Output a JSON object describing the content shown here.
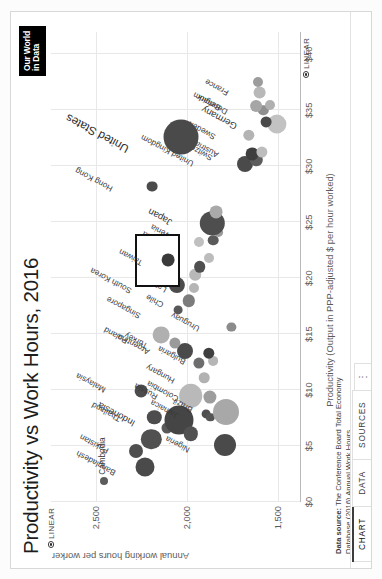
{
  "header": {
    "title": "Productivity vs Work Hours, 2016",
    "logo_line1": "Our World",
    "logo_line2": "in Data"
  },
  "tabs": [
    {
      "label": "CHART",
      "name": "tab-chart",
      "active": true
    },
    {
      "label": "DATA",
      "name": "tab-data",
      "active": false
    },
    {
      "label": "SOURCES",
      "name": "tab-sources",
      "active": false
    },
    {
      "label": "⋮",
      "name": "tab-more-menu",
      "active": false
    }
  ],
  "controls": {
    "x_scale_label": "LINEAR",
    "y_scale_label": "LINEAR"
  },
  "footer": {
    "source_label": "Data source:",
    "source_line1": "The Conference Board Total Economy",
    "source_line2": "Database (2016) Annual Work Hours",
    "license_line": "OurWorldInData.org/working-hours • CC BY-SA"
  },
  "chart_data": {
    "type": "scatter",
    "title": "Productivity vs Work Hours, 2016",
    "xlabel": "Productivity (Output in PPP-adjusted $ per hour worked)",
    "ylabel": "Annual working hours per worker",
    "xlim": [
      0,
      42
    ],
    "ylim": [
      1380,
      2750
    ],
    "xscale": "linear",
    "yscale": "linear",
    "grid": true,
    "legend": false,
    "xticks": [
      "$0",
      "$5",
      "$10",
      "$15",
      "$20",
      "$25",
      "$30",
      "$35",
      "$40"
    ],
    "xtick_values": [
      0,
      5,
      10,
      15,
      20,
      25,
      30,
      35,
      40
    ],
    "yticks": [
      "2,500",
      "2,000",
      "1,500"
    ],
    "ytick_values": [
      2500,
      2000,
      1500
    ],
    "highlighted_entity": "Taiwan",
    "size_encoding": "population",
    "points": [
      {
        "label": "Cambodia",
        "x": 1.9,
        "y": 2456,
        "r": 4.0,
        "color": "#5c5c5c",
        "lx": 6,
        "ly": -5
      },
      {
        "label": "Bangladesh",
        "x": 3.1,
        "y": 2232,
        "r": 9.5,
        "color": "#4a4a4a",
        "lx": -2,
        "ly": -36,
        "rot": -62
      },
      {
        "label": "Pakistan",
        "x": 4.6,
        "y": 2282,
        "r": 7.0,
        "color": "#4f4f4f",
        "lx": 4,
        "ly": -34,
        "rot": -62
      },
      {
        "label": "",
        "x": 5.6,
        "y": 2195,
        "r": 10.2,
        "color": "#515151"
      },
      {
        "label": "",
        "x": 6.6,
        "y": 2110,
        "r": 5.5,
        "color": "#595959"
      },
      {
        "label": "Thailand",
        "x": 7.6,
        "y": 2180,
        "r": 7.2,
        "color": "#4d4d4d",
        "lx": 2,
        "ly": -40,
        "rot": -62
      },
      {
        "label": "Malaysia",
        "x": 9.9,
        "y": 2250,
        "r": 6.4,
        "color": "#4c4c4c",
        "lx": 5,
        "ly": -42,
        "rot": -62
      },
      {
        "label": "Indonesia",
        "x": 7.3,
        "y": 2045,
        "r": 14.5,
        "color": "#454545",
        "lx": 0,
        "ly": -52,
        "rot": -62
      },
      {
        "label": "",
        "x": 6.1,
        "y": 1978,
        "r": 7.2,
        "color": "#515151"
      },
      {
        "label": "Russia",
        "x": 9.5,
        "y": 1978,
        "r": 11.8,
        "color": "#b9b9b9",
        "lx": 3,
        "ly": -40,
        "rot": -62
      },
      {
        "label": "Jamaica",
        "x": 7.9,
        "y": 1895,
        "r": 4.4,
        "color": "#4f4f4f",
        "lx": 2,
        "ly": -34,
        "rot": -62
      },
      {
        "label": "",
        "x": 7.6,
        "y": 1870,
        "r": 4.2,
        "color": "#555"
      },
      {
        "label": "Nigeria",
        "x": 5.1,
        "y": 1790,
        "r": 11.0,
        "color": "#4a4a4a",
        "lx": -1,
        "ly": -42,
        "rot": -62
      },
      {
        "label": "Brazil",
        "x": 8.0,
        "y": 1785,
        "r": 13.0,
        "color": "#a8a8a8",
        "lx": 6,
        "ly": -40,
        "rot": -62
      },
      {
        "label": "Colombia",
        "x": 9.4,
        "y": 1875,
        "r": 6.6,
        "color": "#9d9d9d",
        "lx": 2,
        "ly": -38,
        "rot": -62
      },
      {
        "label": "Hungary",
        "x": 11.1,
        "y": 1905,
        "r": 5.3,
        "color": "#b2b2b2",
        "lx": 1,
        "ly": -36,
        "rot": -62
      },
      {
        "label": "",
        "x": 12.4,
        "y": 1935,
        "r": 5.6,
        "color": "#6d6d6d"
      },
      {
        "label": "Bulgaria",
        "x": 12.6,
        "y": 1855,
        "r": 4.9,
        "color": "#b6b6b6",
        "lx": 3,
        "ly": -34,
        "rot": -62
      },
      {
        "label": "",
        "x": 13.3,
        "y": 1880,
        "r": 5.7,
        "color": "#3f3f3f"
      },
      {
        "label": "Argentina",
        "x": 13.5,
        "y": 2010,
        "r": 8.0,
        "color": "#4a4a4a",
        "lx": 3,
        "ly": -42,
        "rot": -62
      },
      {
        "label": "Turkey",
        "x": 14.2,
        "y": 2065,
        "r": 5.6,
        "color": "#9a9a9a",
        "lx": 1,
        "ly": -34,
        "rot": -62
      },
      {
        "label": "Poland",
        "x": 14.9,
        "y": 2140,
        "r": 8.4,
        "color": "#b0b0b0",
        "lx": -2,
        "ly": -40,
        "rot": -62
      },
      {
        "label": "Uruguay",
        "x": 15.6,
        "y": 1755,
        "r": 4.6,
        "color": "#8b8b8b",
        "lx": 2,
        "ly": -38,
        "rot": -62
      },
      {
        "label": "Chile",
        "x": 18.0,
        "y": 1990,
        "r": 6.2,
        "color": "#7c7c7c",
        "lx": 0,
        "ly": -32,
        "rot": -62
      },
      {
        "label": "Latvia",
        "x": 19.1,
        "y": 1960,
        "r": 5.0,
        "color": "#b5b5b5",
        "lx": 2,
        "ly": -34,
        "rot": -62
      },
      {
        "label": "",
        "x": 20.3,
        "y": 1955,
        "r": 5.8,
        "color": "#b8b8b8"
      },
      {
        "label": "Slovakia",
        "x": 21.8,
        "y": 1880,
        "r": 5.0,
        "color": "#bcbcbc",
        "lx": 2,
        "ly": -40,
        "rot": -62
      },
      {
        "label": "Israel",
        "x": 21.0,
        "y": 1930,
        "r": 5.8,
        "color": "#4f4f4f",
        "lx": 0,
        "ly": -34,
        "rot": -62
      },
      {
        "label": "Slovenia",
        "x": 23.4,
        "y": 1855,
        "r": 5.3,
        "color": "#5a5a5a",
        "lx": 3,
        "ly": -40,
        "rot": -62
      },
      {
        "label": "",
        "x": 24.1,
        "y": 1825,
        "r": 4.9,
        "color": "#9a9a9a"
      },
      {
        "label": "Japan",
        "x": 24.9,
        "y": 1860,
        "r": 12.2,
        "color": "#4e4e4e",
        "lx": 4,
        "ly": -48,
        "rot": -62
      },
      {
        "label": "",
        "x": 25.9,
        "y": 1840,
        "r": 6.4,
        "color": "#a9a9a9"
      },
      {
        "label": "Estonia",
        "x": 23.2,
        "y": 1935,
        "r": 5.0,
        "color": "#c0c0c0",
        "lx": 0,
        "ly": -38,
        "rot": -62
      },
      {
        "label": "South Korea",
        "x": 19.4,
        "y": 2055,
        "r": 8.1,
        "color": "#4c4c4c",
        "lx": -2,
        "ly": -52,
        "rot": -62
      },
      {
        "label": "Singapore",
        "x": 17.2,
        "y": 2050,
        "r": 4.4,
        "color": "#585858",
        "lx": -2,
        "ly": -44,
        "rot": -62
      },
      {
        "label": "Taiwan",
        "x": 21.6,
        "y": 2105,
        "r": 6.4,
        "color": "#3a3a3a",
        "lx": 1,
        "ly": -32,
        "rot": -62,
        "highlight": true
      },
      {
        "label": "Hong Kong",
        "x": 28.2,
        "y": 2190,
        "r": 5.4,
        "color": "#4b4b4b",
        "lx": 1,
        "ly": -46,
        "rot": -62
      },
      {
        "label": "United Kingdom",
        "x": 30.2,
        "y": 1680,
        "r": 8.0,
        "color": "#4a4a4a",
        "lx": 4,
        "ly": -58,
        "rot": -62
      },
      {
        "label": "Switzerland",
        "x": 30.6,
        "y": 1618,
        "r": 6.2,
        "color": "#5d5d5d",
        "lx": 6,
        "ly": -50,
        "rot": -62
      },
      {
        "label": "Austria",
        "x": 31.1,
        "y": 1640,
        "r": 6.4,
        "color": "#3e3e3e",
        "lx": 3,
        "ly": -40,
        "rot": -62
      },
      {
        "label": "",
        "x": 31.3,
        "y": 1586,
        "r": 5.6,
        "color": "#bdbdbd"
      },
      {
        "label": "Sweden",
        "x": 32.8,
        "y": 1660,
        "r": 5.7,
        "color": "#b4b4b4",
        "lx": 2,
        "ly": -40,
        "rot": -62
      },
      {
        "label": "Germany",
        "x": 33.8,
        "y": 1505,
        "r": 9.6,
        "color": "#c2c2c2",
        "lx": 1,
        "ly": -48,
        "rot": -62
      },
      {
        "label": "",
        "x": 34.0,
        "y": 1565,
        "r": 5.4,
        "color": "#4a4a4a"
      },
      {
        "label": "Denmark",
        "x": 35.0,
        "y": 1580,
        "r": 5.2,
        "color": "#8f8f8f",
        "lx": 2,
        "ly": -42,
        "rot": -62
      },
      {
        "label": "",
        "x": 35.5,
        "y": 1540,
        "r": 5.0,
        "color": "#b0b0b0"
      },
      {
        "label": "Belgium",
        "x": 35.4,
        "y": 1620,
        "r": 5.9,
        "color": "#a6a6a6",
        "lx": 2,
        "ly": -42,
        "rot": -62
      },
      {
        "label": "France",
        "x": 36.6,
        "y": 1600,
        "r": 6.4,
        "color": "#b8b8b8",
        "lx": 3,
        "ly": -38,
        "rot": -62
      },
      {
        "label": "",
        "x": 37.5,
        "y": 1610,
        "r": 5.0,
        "color": "#9c9c9c"
      },
      {
        "label": "United States",
        "x": 32.6,
        "y": 2033,
        "r": 17.5,
        "color": "#4a4a4a",
        "lx": -8,
        "ly": -62,
        "rot": -62
      }
    ]
  }
}
